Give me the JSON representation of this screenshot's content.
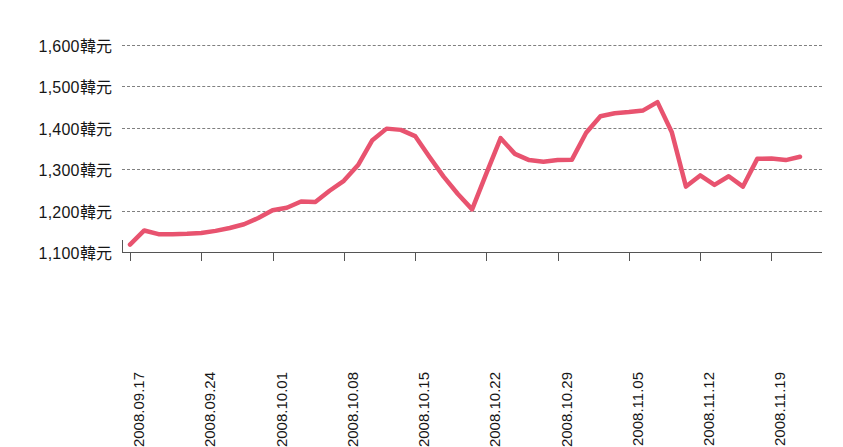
{
  "chart_data": {
    "type": "line",
    "title": "",
    "subtitle": "",
    "xlabel": "",
    "ylabel": "",
    "unit_suffix": "韓元",
    "series_color": "#e8536f",
    "grid": true,
    "legend": "none",
    "ylim": [
      1100,
      1600
    ],
    "yticks": [
      1600,
      1500,
      1400,
      1300,
      1200,
      1100
    ],
    "ytick_labels": [
      "1,600韓元",
      "1,500韓元",
      "1,400韓元",
      "1,300韓元",
      "1,200韓元",
      "1,100韓元"
    ],
    "xtick_labels": [
      "2008.09.17",
      "2008.09.24",
      "2008.10.01",
      "2008.10.08",
      "2008.10.15",
      "2008.10.22",
      "2008.10.29",
      "2008.11.05",
      "2008.11.12",
      "2008.11.19"
    ],
    "xtick_indices": [
      0,
      5,
      10,
      15,
      20,
      25,
      30,
      35,
      40,
      45
    ],
    "x": [
      "2008.09.17",
      "2008.09.18",
      "2008.09.19",
      "2008.09.22",
      "2008.09.23",
      "2008.09.24",
      "2008.09.25",
      "2008.09.26",
      "2008.09.29",
      "2008.09.30",
      "2008.10.01",
      "2008.10.02",
      "2008.10.03",
      "2008.10.06",
      "2008.10.07",
      "2008.10.08",
      "2008.10.09",
      "2008.10.10",
      "2008.10.13",
      "2008.10.14",
      "2008.10.15",
      "2008.10.16",
      "2008.10.17",
      "2008.10.20",
      "2008.10.21",
      "2008.10.22",
      "2008.10.23",
      "2008.10.24",
      "2008.10.27",
      "2008.10.28",
      "2008.10.29",
      "2008.10.30",
      "2008.10.31",
      "2008.11.03",
      "2008.11.04",
      "2008.11.05",
      "2008.11.06",
      "2008.11.07",
      "2008.11.10",
      "2008.11.11",
      "2008.11.12",
      "2008.11.13",
      "2008.11.14",
      "2008.11.17",
      "2008.11.18",
      "2008.11.19",
      "2008.11.20",
      "2008.11.21"
    ],
    "series": [
      {
        "name": "匯率",
        "color": "#e8536f",
        "values": [
          1118,
          1152,
          1143,
          1143,
          1144,
          1146,
          1151,
          1158,
          1167,
          1182,
          1201,
          1207,
          1222,
          1221,
          1248,
          1272,
          1310,
          1370,
          1398,
          1395,
          1380,
          1330,
          1282,
          1240,
          1203,
          1290,
          1375,
          1337,
          1322,
          1318,
          1322,
          1323,
          1388,
          1428,
          1435,
          1438,
          1442,
          1462,
          1390,
          1258,
          1285,
          1262,
          1283,
          1258,
          1325,
          1326,
          1322,
          1330
        ]
      }
    ],
    "annotations": []
  }
}
